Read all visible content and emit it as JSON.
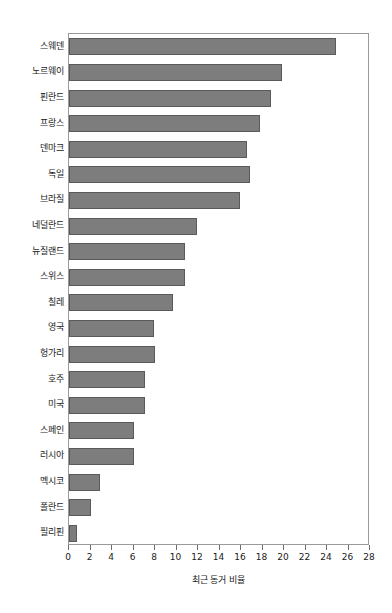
{
  "chart_data": {
    "type": "bar",
    "orientation": "horizontal",
    "title": "",
    "subtitle": "",
    "xlabel": "최근 동거 비율",
    "ylabel": "",
    "xlim": [
      0,
      28
    ],
    "xticks": [
      0,
      2,
      4,
      6,
      8,
      10,
      12,
      14,
      16,
      18,
      20,
      22,
      24,
      26,
      28
    ],
    "grid": false,
    "legend": null,
    "bar_color": "#7d7d7d",
    "bar_edge_color": "#5a5a5a",
    "frame_color": "#9a9a9a",
    "categories": [
      "스웨덴",
      "노르웨이",
      "핀란드",
      "프랑스",
      "덴마크",
      "독일",
      "브라질",
      "네덜란드",
      "뉴질랜드",
      "스위스",
      "칠레",
      "영국",
      "헝가리",
      "호주",
      "미국",
      "스페인",
      "러시아",
      "멕시코",
      "폴란드",
      "필리핀"
    ],
    "values": [
      24.8,
      19.8,
      18.8,
      17.8,
      16.6,
      16.8,
      15.9,
      11.9,
      10.8,
      10.8,
      9.7,
      7.9,
      8.0,
      7.1,
      7.1,
      6.0,
      6.0,
      2.9,
      2.0,
      0.7
    ]
  }
}
